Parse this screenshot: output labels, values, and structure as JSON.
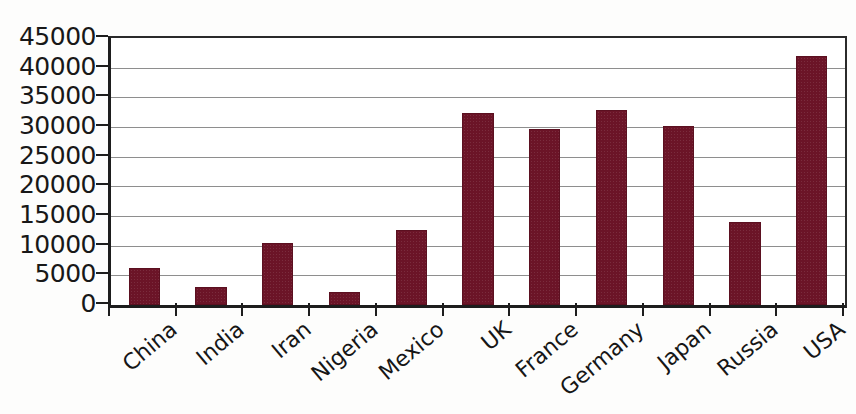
{
  "chart_data": {
    "type": "bar",
    "title": "",
    "subtitle": "",
    "xlabel": "",
    "ylabel": "",
    "categories": [
      "China",
      "India",
      "Iran",
      "Nigeria",
      "Mexico",
      "UK",
      "France",
      "Germany",
      "Japan",
      "Russia",
      "USA"
    ],
    "values": [
      6200,
      3000,
      10500,
      2200,
      12700,
      32300,
      29700,
      32900,
      30100,
      14000,
      42000
    ],
    "ylim": [
      0,
      45000
    ],
    "ytick_step": 5000,
    "ytick_labels": [
      "45000",
      "40000",
      "35000",
      "30000",
      "25000",
      "20000",
      "15000",
      "10000",
      "5000",
      "0"
    ],
    "ytick_values": [
      45000,
      40000,
      35000,
      30000,
      25000,
      20000,
      15000,
      10000,
      5000,
      0
    ],
    "grid": true,
    "grid_axis": "y",
    "legend": false,
    "legend_position": "none",
    "series": [
      {
        "name": "",
        "values": [
          6200,
          3000,
          10500,
          2200,
          12700,
          32300,
          29700,
          32900,
          30100,
          14000,
          42000
        ]
      }
    ],
    "annotations": []
  },
  "style": {
    "bar_color": "#6b1427",
    "bar_edge_color": "#5b1020",
    "grid_color": "#8e8e8e",
    "axis_color": "#1d1d1d",
    "text_color": "#161616",
    "background_color": "#ffffff",
    "x_label_rotation_deg": -40
  }
}
